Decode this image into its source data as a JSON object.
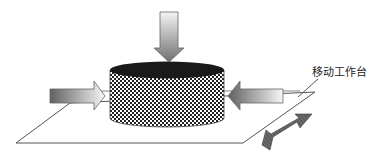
{
  "diagram": {
    "type": "schematic",
    "labels": {
      "worktable": "移动工作台"
    },
    "elements": [
      {
        "id": "workpiece",
        "shape": "cylinder",
        "fill": "checkerboard",
        "top_color": "#1a1a1a"
      },
      {
        "id": "top-force-arrow",
        "direction": "down"
      },
      {
        "id": "left-force-arrow",
        "direction": "right"
      },
      {
        "id": "right-force-arrow",
        "direction": "left"
      },
      {
        "id": "worktable",
        "shape": "parallelogram"
      },
      {
        "id": "motion-arrow",
        "direction": "bidirectional-diagonal"
      }
    ],
    "colors": {
      "outline": "#555555",
      "arrow_dark": "#666666",
      "arrow_light": "#f2f2f2",
      "cylinder_top": "#1a1a1a",
      "double_arrow": "#5a5a5a"
    }
  }
}
